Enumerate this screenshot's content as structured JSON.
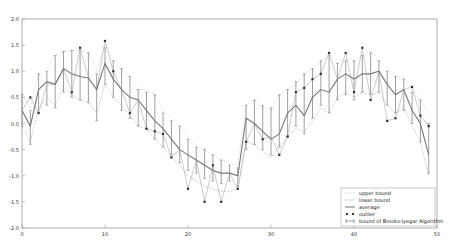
{
  "chart_data": {
    "type": "line",
    "title": "",
    "xlabel": "",
    "ylabel": "",
    "xlim": [
      0,
      50
    ],
    "ylim": [
      -2.0,
      2.0
    ],
    "grid": false,
    "legend_position": "lower right",
    "x_ticks": [
      "0",
      "10",
      "20",
      "30",
      "40",
      "50"
    ],
    "y_ticks": [
      "2.0",
      "1.5",
      "1.0",
      "0.5",
      "0.0",
      "-0.5",
      "-1.0",
      "-1.5",
      "-2.0"
    ],
    "legend": [
      "upper bound",
      "lower bound",
      "average",
      "outlier",
      "bound of Brooks-Iyegar Algorithm"
    ],
    "x": [
      0,
      1,
      2,
      3,
      4,
      5,
      6,
      7,
      8,
      9,
      10,
      11,
      12,
      13,
      14,
      15,
      16,
      17,
      18,
      19,
      20,
      21,
      22,
      23,
      24,
      25,
      26,
      27,
      28,
      29,
      30,
      31,
      32,
      33,
      34,
      35,
      36,
      37,
      38,
      39,
      40,
      41,
      42,
      43,
      44,
      45,
      46,
      47,
      48,
      49
    ],
    "series": [
      {
        "name": "upper bound",
        "values": [
          0.6,
          0.3,
          0.95,
          1.05,
          1.3,
          1.38,
          1.4,
          1.4,
          1.35,
          1.0,
          1.5,
          1.25,
          1.0,
          0.9,
          0.65,
          0.65,
          0.55,
          0.25,
          0.1,
          -0.05,
          -0.25,
          -0.4,
          -0.5,
          -0.6,
          -0.7,
          -0.75,
          -0.8,
          0.35,
          0.45,
          0.3,
          0.25,
          0.55,
          0.65,
          0.75,
          0.95,
          1.05,
          1.2,
          1.3,
          1.15,
          1.25,
          1.2,
          1.3,
          1.4,
          1.2,
          1.05,
          0.95,
          0.85,
          0.65,
          0.45,
          0.2
        ]
      },
      {
        "name": "lower bound",
        "values": [
          -0.05,
          -0.35,
          0.3,
          0.5,
          0.35,
          0.7,
          0.55,
          0.45,
          0.4,
          0.2,
          0.75,
          0.5,
          0.35,
          0.15,
          -0.05,
          -0.1,
          -0.3,
          -0.45,
          -0.65,
          -0.8,
          -1.0,
          -1.1,
          -1.2,
          -1.25,
          -1.3,
          -1.3,
          -1.25,
          -0.35,
          -0.4,
          -0.55,
          -0.65,
          -0.45,
          -0.25,
          -0.1,
          -0.15,
          0.05,
          0.3,
          0.2,
          0.5,
          0.6,
          0.5,
          0.6,
          0.55,
          0.6,
          0.35,
          0.2,
          0.3,
          -0.05,
          -0.35,
          -1.0
        ]
      },
      {
        "name": "average",
        "values": [
          0.25,
          -0.05,
          0.65,
          0.8,
          0.75,
          1.05,
          0.95,
          0.9,
          0.87,
          0.65,
          1.15,
          0.85,
          0.65,
          0.5,
          0.45,
          0.25,
          0.05,
          -0.1,
          -0.3,
          -0.5,
          -0.6,
          -0.7,
          -0.8,
          -0.9,
          -0.95,
          -0.95,
          -1.0,
          0.1,
          0.0,
          -0.15,
          -0.3,
          -0.2,
          0.2,
          0.35,
          0.15,
          0.5,
          0.65,
          0.6,
          0.85,
          0.95,
          0.85,
          0.95,
          0.95,
          1.0,
          0.75,
          0.55,
          0.65,
          0.25,
          0.0,
          -0.6
        ]
      },
      {
        "name": "outlier",
        "values": [
          0.25,
          0.5,
          0.2,
          0.75,
          0.75,
          1.05,
          0.6,
          1.45,
          0.87,
          0.65,
          1.58,
          1.0,
          0.65,
          0.2,
          0.45,
          -0.1,
          -0.15,
          -0.2,
          -0.65,
          -0.5,
          -1.25,
          -0.7,
          -1.5,
          -0.8,
          -1.5,
          -0.95,
          -1.25,
          -0.35,
          0.0,
          -0.3,
          -0.25,
          -0.6,
          -0.25,
          0.6,
          0.68,
          0.85,
          0.95,
          1.35,
          0.85,
          1.35,
          0.6,
          1.45,
          0.45,
          1.0,
          0.05,
          0.1,
          0.65,
          0.7,
          0.15,
          -0.05
        ]
      },
      {
        "name": "bound of Brooks-Iyegar Algorithm",
        "low": [
          -0.05,
          -0.4,
          0.2,
          0.35,
          0.3,
          0.6,
          0.5,
          0.45,
          0.4,
          0.05,
          0.75,
          0.5,
          0.25,
          0.1,
          -0.05,
          -0.1,
          -0.3,
          -0.45,
          -0.6,
          -0.75,
          -0.9,
          -0.95,
          -1.05,
          -1.1,
          -1.15,
          -1.1,
          -1.2,
          -0.5,
          -0.4,
          -0.5,
          -0.6,
          -0.45,
          -0.25,
          -0.05,
          -0.2,
          0.1,
          0.35,
          0.2,
          0.45,
          0.55,
          0.45,
          0.6,
          0.55,
          0.6,
          0.35,
          0.2,
          0.25,
          0.0,
          -0.35,
          -0.95
        ],
        "high": [
          0.55,
          0.25,
          0.95,
          1.0,
          1.3,
          1.38,
          1.4,
          1.4,
          1.35,
          0.95,
          1.45,
          1.2,
          1.05,
          0.9,
          0.65,
          0.6,
          0.55,
          0.2,
          0.05,
          -0.05,
          -0.3,
          -0.45,
          -0.5,
          -0.6,
          -0.7,
          -0.8,
          -0.85,
          0.35,
          0.45,
          0.35,
          0.3,
          0.55,
          0.65,
          0.8,
          0.95,
          1.05,
          1.2,
          1.3,
          1.15,
          1.2,
          1.2,
          1.3,
          1.35,
          1.2,
          1.0,
          0.9,
          0.85,
          0.6,
          0.45,
          0.0
        ]
      }
    ]
  }
}
